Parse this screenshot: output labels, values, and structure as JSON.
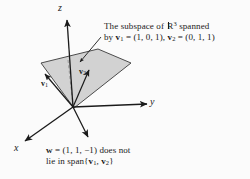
{
  "figure": {
    "background_color": "#fbfbfb",
    "ink_color": "#1a1a1a",
    "plane_fill_color": "#d2d2d2",
    "plane_stroke_color": "#3a3a3a",
    "axes": {
      "z_label": "z",
      "y_label": "y",
      "x_label": "x"
    },
    "vectors": [
      {
        "key": "v1",
        "label": "v",
        "subscript": "1"
      },
      {
        "key": "v2",
        "label": "v",
        "subscript": "2"
      }
    ],
    "annotations": {
      "span": {
        "line1_pre": "The subspace of ",
        "line1_set": "R",
        "line1_exp": "3",
        "line1_post": " spanned",
        "line2_pre": "by ",
        "line2_v1": "v",
        "line2_v1_sub": "1",
        "line2_v1_val": " = (1, 0, 1), ",
        "line2_v2": "v",
        "line2_v2_sub": "2",
        "line2_v2_val": " = (0, 1, 1)"
      },
      "w": {
        "line1_vec": "w",
        "line1_val": " = (1, 1, −1) does not",
        "line2_pre": "lie in span{",
        "line2_v1": "v",
        "line2_v1_sub": "1",
        "line2_sep": ", ",
        "line2_v2": "v",
        "line2_v2_sub": "2",
        "line2_post": "}"
      }
    }
  }
}
